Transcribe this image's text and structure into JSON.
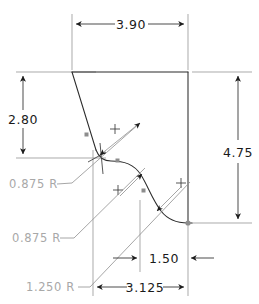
{
  "drawing": {
    "title": "Cam profile dimensioned sketch",
    "units_note": "",
    "colors": {
      "object_line": "#2b2b2b",
      "dimension_line": "#2b2b2b",
      "extension_line": "#9b9b9b",
      "radius_label": "#a8a8a8",
      "dimension_label": "#1a1a1a",
      "node_marker": "#8d8d8d",
      "background": "#ffffff"
    },
    "dimensions": [
      {
        "id": "overall-width",
        "label": "3.90",
        "orientation": "horizontal",
        "position": "top"
      },
      {
        "id": "upper-height",
        "label": "2.80",
        "orientation": "vertical",
        "position": "left"
      },
      {
        "id": "overall-height",
        "label": "4.75",
        "orientation": "vertical",
        "position": "right"
      },
      {
        "id": "lower-right-offset",
        "label": "1.50",
        "orientation": "horizontal",
        "position": "bottom-inner"
      },
      {
        "id": "lower-width",
        "label": "3.125",
        "orientation": "horizontal",
        "position": "bottom"
      }
    ],
    "radii": [
      {
        "id": "radius-upper",
        "label": "0.875 R"
      },
      {
        "id": "radius-middle",
        "label": "0.875 R"
      },
      {
        "id": "radius-lower",
        "label": "1.250 R"
      }
    ]
  }
}
